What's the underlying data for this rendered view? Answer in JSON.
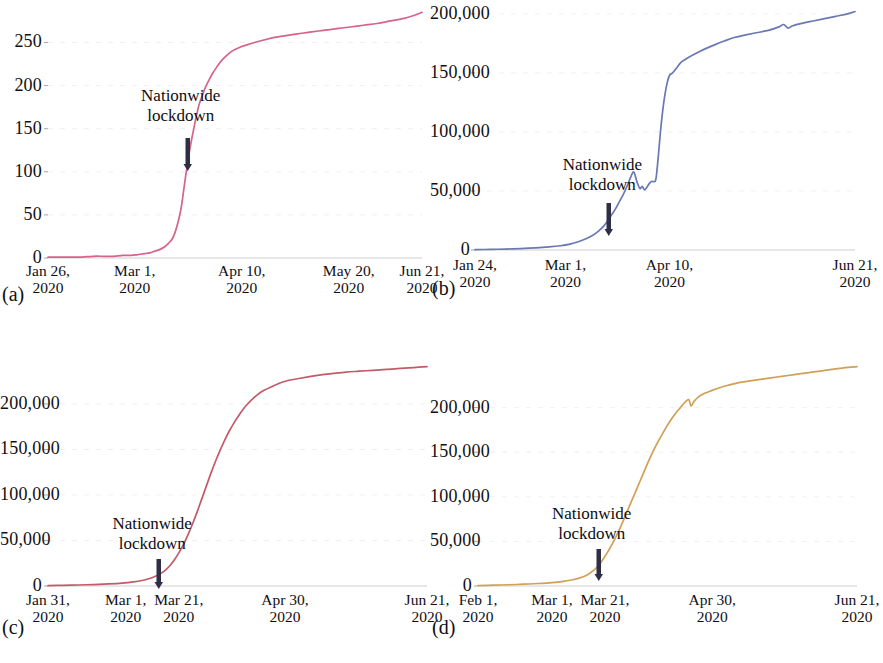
{
  "figure": {
    "background": "#ffffff",
    "panel_count": 4
  },
  "panels": [
    {
      "id": "a",
      "letter": "(a)",
      "annotation_line1": "Nationwide",
      "annotation_line2": "lockdown",
      "color": "#d6638c",
      "yticks": [
        "0",
        "50",
        "100",
        "150",
        "200",
        "250"
      ],
      "xticks": [
        {
          "l1": "Jan 26,",
          "l2": "2020"
        },
        {
          "l1": "Mar 1,",
          "l2": "2020"
        },
        {
          "l1": "Apr 10,",
          "l2": "2020"
        },
        {
          "l1": "May 20,",
          "l2": "2020"
        },
        {
          "l1": "Jun 21,",
          "l2": "2020"
        }
      ]
    },
    {
      "id": "b",
      "letter": "(b)",
      "annotation_line1": "Nationwide",
      "annotation_line2": "lockdown",
      "color": "#6a78b4",
      "yticks": [
        "0",
        "50,000",
        "100,000",
        "150,000",
        "200,000"
      ],
      "xticks": [
        {
          "l1": "Jan 24,",
          "l2": "2020"
        },
        {
          "l1": "Mar 1,",
          "l2": "2020"
        },
        {
          "l1": "Apr 10,",
          "l2": "2020"
        },
        {
          "l1": "Jun 21,",
          "l2": "2020"
        }
      ]
    },
    {
      "id": "c",
      "letter": "(c)",
      "annotation_line1": "Nationwide",
      "annotation_line2": "lockdown",
      "color": "#c35a6a",
      "yticks": [
        "0",
        "50,000",
        "100,000",
        "150,000",
        "200,000"
      ],
      "xticks": [
        {
          "l1": "Jan 31,",
          "l2": "2020"
        },
        {
          "l1": "Mar 1,",
          "l2": "2020"
        },
        {
          "l1": "Mar 21,",
          "l2": "2020"
        },
        {
          "l1": "Apr 30,",
          "l2": "2020"
        },
        {
          "l1": "Jun 21,",
          "l2": "2020"
        }
      ]
    },
    {
      "id": "d",
      "letter": "(d)",
      "annotation_line1": "Nationwide",
      "annotation_line2": "lockdown",
      "color": "#cfa055",
      "yticks": [
        "0",
        "50,000",
        "100,000",
        "150,000",
        "200,000"
      ],
      "xticks": [
        {
          "l1": "Feb 1,",
          "l2": "2020"
        },
        {
          "l1": "Mar 1,",
          "l2": "2020"
        },
        {
          "l1": "Mar 21,",
          "l2": "2020"
        },
        {
          "l1": "Apr 30,",
          "l2": "2020"
        },
        {
          "l1": "Jun 21,",
          "l2": "2020"
        }
      ]
    }
  ],
  "chart_data": [
    {
      "type": "line",
      "panel": "a",
      "title": "",
      "xlabel": "",
      "ylabel": "",
      "grid": false,
      "legend": null,
      "color": "#d6638c",
      "ylim": [
        0,
        290
      ],
      "yticks": [
        0,
        50,
        100,
        150,
        200,
        250
      ],
      "ytick_labels": [
        "0",
        "50",
        "100",
        "150",
        "200",
        "250"
      ],
      "xtick_labels": [
        "Jan 26, 2020",
        "Mar 1, 2020",
        "Apr 10, 2020",
        "May 20, 2020",
        "Jun 21, 2020"
      ],
      "xtick_positions": [
        0.0,
        0.232,
        0.518,
        0.804,
        1.0
      ],
      "annotations": [
        {
          "text": "Nationwide lockdown",
          "x_frac": 0.355,
          "marker": "down-arrow"
        }
      ],
      "x": [
        0.0,
        0.03,
        0.06,
        0.09,
        0.12,
        0.15,
        0.175,
        0.2,
        0.222,
        0.24,
        0.258,
        0.272,
        0.286,
        0.3,
        0.312,
        0.322,
        0.332,
        0.34,
        0.348,
        0.356,
        0.362,
        0.368,
        0.374,
        0.38,
        0.386,
        0.392,
        0.398,
        0.404,
        0.412,
        0.42,
        0.43,
        0.44,
        0.452,
        0.464,
        0.478,
        0.492,
        0.51,
        0.53,
        0.552,
        0.578,
        0.606,
        0.636,
        0.668,
        0.7,
        0.736,
        0.772,
        0.808,
        0.844,
        0.88,
        0.916,
        0.952,
        0.976,
        1.0
      ],
      "y": [
        1,
        1,
        1,
        1,
        2,
        2,
        2,
        3,
        3,
        4,
        5,
        6,
        8,
        10,
        13,
        17,
        22,
        30,
        42,
        58,
        76,
        95,
        112,
        128,
        142,
        155,
        167,
        178,
        188,
        197,
        206,
        214,
        222,
        229,
        235,
        240,
        244,
        247,
        250,
        253,
        256,
        258,
        260,
        262,
        264,
        266,
        268,
        270,
        272,
        275,
        278,
        281,
        285
      ]
    },
    {
      "type": "line",
      "panel": "b",
      "title": "",
      "xlabel": "",
      "ylabel": "",
      "grid": false,
      "legend": null,
      "color": "#6a78b4",
      "ylim": [
        0,
        205000
      ],
      "yticks": [
        0,
        50000,
        100000,
        150000,
        200000
      ],
      "ytick_labels": [
        "0",
        "50,000",
        "100,000",
        "150,000",
        "200,000"
      ],
      "xtick_labels": [
        "Jan 24, 2020",
        "Mar 1, 2020",
        "Apr 10, 2020",
        "Jun 21, 2020"
      ],
      "xtick_positions": [
        0.0,
        0.238,
        0.512,
        1.0
      ],
      "annotations": [
        {
          "text": "Nationwide lockdown",
          "x_frac": 0.335,
          "marker": "down-arrow"
        }
      ],
      "x": [
        0.0,
        0.04,
        0.08,
        0.12,
        0.16,
        0.195,
        0.225,
        0.25,
        0.272,
        0.292,
        0.31,
        0.325,
        0.338,
        0.35,
        0.36,
        0.37,
        0.38,
        0.39,
        0.4,
        0.41,
        0.418,
        0.426,
        0.434,
        0.44,
        0.446,
        0.452,
        0.458,
        0.464,
        0.47,
        0.476,
        0.482,
        0.488,
        0.494,
        0.5,
        0.506,
        0.512,
        0.52,
        0.53,
        0.542,
        0.556,
        0.572,
        0.59,
        0.61,
        0.632,
        0.656,
        0.682,
        0.71,
        0.74,
        0.772,
        0.8,
        0.812,
        0.824,
        0.836,
        0.86,
        0.89,
        0.92,
        0.95,
        0.98,
        1.0
      ],
      "y": [
        300,
        500,
        800,
        1200,
        1800,
        2600,
        3600,
        5000,
        7000,
        9500,
        12500,
        16000,
        20000,
        25000,
        30000,
        35000,
        41000,
        47000,
        54000,
        62000,
        66000,
        58000,
        52000,
        54000,
        51000,
        53000,
        56000,
        58000,
        58000,
        60000,
        78000,
        100000,
        118000,
        132000,
        142000,
        148000,
        150000,
        154000,
        159000,
        162000,
        165000,
        168000,
        171000,
        174000,
        177000,
        180000,
        182000,
        184000,
        186000,
        189000,
        191000,
        188000,
        190000,
        192000,
        194000,
        196000,
        198000,
        200000,
        202000
      ]
    },
    {
      "type": "line",
      "panel": "c",
      "title": "",
      "xlabel": "",
      "ylabel": "",
      "grid": false,
      "legend": null,
      "color": "#c35a6a",
      "ylim": [
        0,
        245000
      ],
      "yticks": [
        0,
        50000,
        100000,
        150000,
        200000
      ],
      "ytick_labels": [
        "0",
        "50,000",
        "100,000",
        "150,000",
        "200,000"
      ],
      "xtick_labels": [
        "Jan 31, 2020",
        "Mar 1, 2020",
        "Mar 21, 2020",
        "Apr 30, 2020",
        "Jun 21, 2020"
      ],
      "xtick_positions": [
        0.0,
        0.205,
        0.345,
        0.625,
        1.0
      ],
      "annotations": [
        {
          "text": "Nationwide lockdown",
          "x_frac": 0.275,
          "marker": "down-arrow"
        }
      ],
      "x": [
        0.0,
        0.04,
        0.08,
        0.12,
        0.16,
        0.195,
        0.225,
        0.248,
        0.266,
        0.282,
        0.296,
        0.31,
        0.322,
        0.334,
        0.346,
        0.358,
        0.37,
        0.382,
        0.394,
        0.406,
        0.418,
        0.43,
        0.442,
        0.454,
        0.466,
        0.478,
        0.492,
        0.506,
        0.52,
        0.536,
        0.552,
        0.57,
        0.59,
        0.612,
        0.636,
        0.662,
        0.69,
        0.72,
        0.752,
        0.786,
        0.822,
        0.858,
        0.894,
        0.93,
        0.965,
        1.0
      ],
      "y": [
        400,
        700,
        1100,
        1600,
        2300,
        3200,
        4500,
        6000,
        8000,
        10500,
        13500,
        17500,
        22500,
        29000,
        37000,
        46000,
        57000,
        69000,
        82000,
        96000,
        110000,
        124000,
        137000,
        149000,
        160000,
        170000,
        180000,
        189000,
        197000,
        204000,
        210000,
        215000,
        219000,
        223000,
        226000,
        228000,
        230000,
        232000,
        233500,
        235000,
        236000,
        237000,
        238000,
        239000,
        240000,
        241000
      ]
    },
    {
      "type": "line",
      "panel": "d",
      "title": "",
      "xlabel": "",
      "ylabel": "",
      "grid": false,
      "legend": null,
      "color": "#cfa055",
      "ylim": [
        0,
        250000
      ],
      "yticks": [
        0,
        50000,
        100000,
        150000,
        200000
      ],
      "ytick_labels": [
        "0",
        "50,000",
        "100,000",
        "150,000",
        "200,000"
      ],
      "xtick_labels": [
        "Feb 1, 2020",
        "Mar 1, 2020",
        "Mar 21, 2020",
        "Apr 30, 2020",
        "Jun 21, 2020"
      ],
      "xtick_positions": [
        0.0,
        0.195,
        0.335,
        0.618,
        1.0
      ],
      "annotations": [
        {
          "text": "Nationwide lockdown",
          "x_frac": 0.3,
          "marker": "down-arrow"
        }
      ],
      "x": [
        0.0,
        0.04,
        0.08,
        0.12,
        0.16,
        0.195,
        0.225,
        0.25,
        0.272,
        0.29,
        0.305,
        0.318,
        0.33,
        0.342,
        0.354,
        0.366,
        0.378,
        0.39,
        0.402,
        0.414,
        0.426,
        0.438,
        0.45,
        0.462,
        0.474,
        0.486,
        0.498,
        0.51,
        0.522,
        0.534,
        0.546,
        0.556,
        0.562,
        0.57,
        0.582,
        0.598,
        0.616,
        0.636,
        0.66,
        0.688,
        0.718,
        0.75,
        0.784,
        0.818,
        0.852,
        0.886,
        0.92,
        0.955,
        1.0
      ],
      "y": [
        500,
        900,
        1400,
        2000,
        2800,
        3800,
        5200,
        7000,
        9500,
        13000,
        17500,
        23000,
        30000,
        38000,
        47000,
        57000,
        68000,
        80000,
        92000,
        104000,
        116000,
        128000,
        140000,
        151000,
        161000,
        170000,
        179000,
        187000,
        194000,
        200000,
        206000,
        209000,
        202000,
        207000,
        212000,
        216000,
        219000,
        222000,
        225000,
        228000,
        230000,
        232000,
        234000,
        236000,
        238000,
        240000,
        242000,
        244000,
        246000
      ]
    }
  ]
}
